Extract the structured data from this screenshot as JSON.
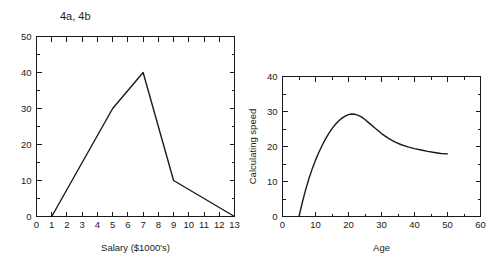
{
  "figure": {
    "title": "4a, 4b",
    "background_color": "#ffffff",
    "line_color": "#1a1a1a"
  },
  "chart_data": [
    {
      "id": "chart-4a",
      "type": "line",
      "title": "",
      "xlabel": "Salary ($1000's)",
      "ylabel": "",
      "xlim": [
        0,
        13
      ],
      "ylim": [
        0,
        50
      ],
      "grid": false,
      "legend": "none",
      "x_ticks": [
        0,
        1,
        2,
        3,
        4,
        5,
        6,
        7,
        8,
        9,
        10,
        11,
        12,
        13
      ],
      "x_tick_labels": [
        "0",
        "1",
        "2",
        "3",
        "4",
        "5",
        "6",
        "7",
        "8",
        "9",
        "10",
        "11",
        "12",
        "13"
      ],
      "y_ticks": [
        0,
        10,
        20,
        30,
        40,
        50
      ],
      "y_tick_labels": [
        "0",
        "10",
        "20",
        "30",
        "40",
        "50"
      ],
      "y_minor_ticks": [
        5,
        15,
        25,
        35,
        45
      ],
      "x": [
        1,
        5,
        7,
        9,
        13
      ],
      "y": [
        0,
        30,
        40,
        10,
        0
      ]
    },
    {
      "id": "chart-4b",
      "type": "line",
      "title": "",
      "xlabel": "Age",
      "ylabel": "Calculating speed",
      "xlim": [
        0,
        60
      ],
      "ylim": [
        0,
        40
      ],
      "grid": false,
      "legend": "none",
      "x_ticks": [
        0,
        10,
        20,
        30,
        40,
        50,
        60
      ],
      "x_tick_labels": [
        "0",
        "10",
        "20",
        "30",
        "40",
        "50",
        "60"
      ],
      "x_minor_ticks": [
        5,
        15,
        25,
        35,
        45,
        55
      ],
      "y_ticks": [
        0,
        10,
        20,
        30,
        40
      ],
      "y_tick_labels": [
        "0",
        "10",
        "20",
        "30",
        "40"
      ],
      "y_minor_ticks": [
        5,
        15,
        25,
        35
      ],
      "x": [
        5,
        6,
        7,
        8,
        9,
        10,
        11,
        12,
        13,
        14,
        15,
        16,
        17,
        18,
        19,
        20,
        21,
        22,
        23,
        24,
        25,
        26,
        27,
        28,
        29,
        30,
        32,
        34,
        36,
        38,
        40,
        42,
        44,
        46,
        48,
        50
      ],
      "y": [
        0,
        4.0,
        7.6,
        10.8,
        13.6,
        16.1,
        18.3,
        20.3,
        22.1,
        23.7,
        25.1,
        26.3,
        27.3,
        28.1,
        28.7,
        29.1,
        29.3,
        29.2,
        28.9,
        28.4,
        27.7,
        26.9,
        26.1,
        25.3,
        24.5,
        23.7,
        22.4,
        21.3,
        20.5,
        19.9,
        19.4,
        19.0,
        18.6,
        18.3,
        18.0,
        17.9
      ]
    }
  ]
}
